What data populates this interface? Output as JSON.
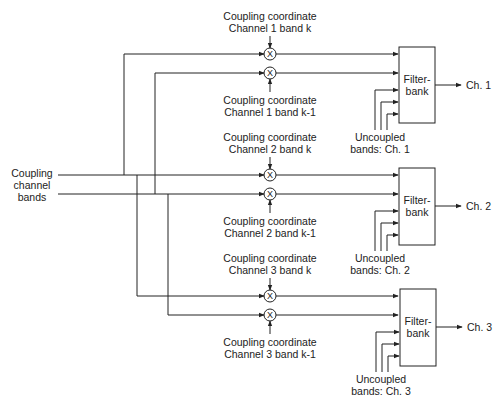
{
  "diagram": {
    "input": {
      "line1": "Coupling",
      "line2": "channel",
      "line3": "bands"
    },
    "multiplier_symbol": "X",
    "channels": [
      {
        "id": "ch1",
        "coord_k": {
          "line1": "Coupling coordinate",
          "line2": "Channel 1 band k"
        },
        "coord_k1": {
          "line1": "Coupling coordinate",
          "line2": "Channel 1 band k-1"
        },
        "filterbank": {
          "line1": "Filter-",
          "line2": "bank"
        },
        "uncoupled": {
          "line1": "Uncoupled",
          "line2": "bands: Ch. 1"
        },
        "output": "Ch. 1"
      },
      {
        "id": "ch2",
        "coord_k": {
          "line1": "Coupling coordinate",
          "line2": "Channel 2 band k"
        },
        "coord_k1": {
          "line1": "Coupling coordinate",
          "line2": "Channel 2 band k-1"
        },
        "filterbank": {
          "line1": "Filter-",
          "line2": "bank"
        },
        "uncoupled": {
          "line1": "Uncoupled",
          "line2": "bands: Ch. 2"
        },
        "output": "Ch. 2"
      },
      {
        "id": "ch3",
        "coord_k": {
          "line1": "Coupling coordinate",
          "line2": "Channel 3 band k"
        },
        "coord_k1": {
          "line1": "Coupling coordinate",
          "line2": "Channel 3 band k-1"
        },
        "filterbank": {
          "line1": "Filter-",
          "line2": "bank"
        },
        "uncoupled": {
          "line1": "Uncoupled",
          "line2": "bands: Ch. 3"
        },
        "output": "Ch. 3"
      }
    ],
    "colors": {
      "line": "#222222",
      "background": "#ffffff"
    }
  }
}
